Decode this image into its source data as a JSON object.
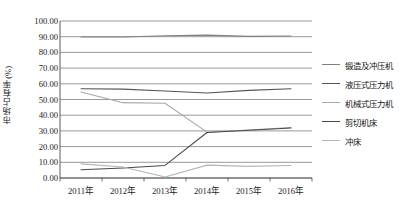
{
  "chart_data": {
    "type": "line",
    "title": "",
    "xlabel": "",
    "ylabel": "市场占有率(%)",
    "categories": [
      "2011年",
      "2012年",
      "2013年",
      "2014年",
      "2015年",
      "2016年"
    ],
    "ylim": [
      0,
      100
    ],
    "ytick_labels": [
      "0.00",
      "10.00",
      "20.00",
      "30.00",
      "40.00",
      "50.00",
      "60.00",
      "70.00",
      "80.00",
      "90.00",
      "100.00"
    ],
    "ytick_values": [
      0,
      10,
      20,
      30,
      40,
      50,
      60,
      70,
      80,
      90,
      100
    ],
    "grid": true,
    "legend_position": "right",
    "series": [
      {
        "name": "锻造及冲压机",
        "color": "#808080",
        "values": [
          89.8,
          89.8,
          90.6,
          91.0,
          90.2,
          90.4
        ]
      },
      {
        "name": "液压式压力机",
        "color": "#555555",
        "values": [
          56.8,
          56.6,
          55.4,
          54.2,
          55.8,
          56.8
        ]
      },
      {
        "name": "机械式压力机",
        "color": "#a8a8a8",
        "values": [
          54.8,
          48.0,
          47.6,
          29.2,
          30.6,
          32.2
        ]
      },
      {
        "name": "剪切机床",
        "color": "#4a4a4a",
        "values": [
          5.2,
          6.4,
          8.0,
          29.0,
          30.4,
          31.8
        ]
      },
      {
        "name": "冲床",
        "color": "#b5b5b5",
        "values": [
          9.0,
          7.0,
          0.6,
          8.2,
          7.4,
          8.0
        ]
      }
    ]
  },
  "axes": {
    "plot_left": 60,
    "plot_right": 312,
    "plot_top": 21,
    "plot_bottom": 178
  }
}
